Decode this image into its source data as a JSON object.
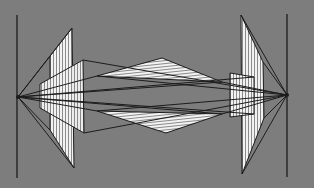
{
  "diagram": {
    "title": "",
    "colors": {
      "background": "#7d7d7d",
      "stroke": "#1c1c1c",
      "plane_fill": "#f2f2f2",
      "stripe": "#8a8a8a"
    },
    "left_focal": {
      "x": 18,
      "y": 97
    },
    "right_focal": {
      "x": 287,
      "y": 95
    },
    "left_axis": {
      "x": 17,
      "y1": 15,
      "y2": 178
    },
    "right_axis": {
      "x": 287,
      "y1": 14,
      "y2": 177
    },
    "planes": [
      {
        "name": "left-tall-plane",
        "points": [
          [
            50,
            56
          ],
          [
            72,
            28
          ],
          [
            74,
            168
          ],
          [
            50,
            130
          ]
        ]
      },
      {
        "name": "left-short-plane",
        "points": [
          [
            40,
            84
          ],
          [
            83,
            60
          ],
          [
            84,
            133
          ],
          [
            40,
            108
          ]
        ]
      },
      {
        "name": "right-tall-plane",
        "points": [
          [
            241,
            15
          ],
          [
            263,
            62
          ],
          [
            264,
            118
          ],
          [
            242,
            174
          ]
        ]
      },
      {
        "name": "right-short-plane",
        "points": [
          [
            230,
            73
          ],
          [
            254,
            77
          ],
          [
            254,
            114
          ],
          [
            230,
            117
          ]
        ]
      },
      {
        "name": "upper-center-wedge",
        "points": [
          [
            97,
            76
          ],
          [
            162,
            58
          ],
          [
            222,
            82
          ]
        ]
      },
      {
        "name": "lower-center-wedge",
        "points": [
          [
            97,
            111
          ],
          [
            166,
            133
          ],
          [
            222,
            114
          ]
        ]
      }
    ]
  }
}
